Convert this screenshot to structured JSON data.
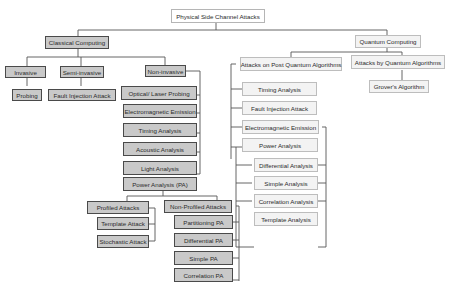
{
  "diagram": {
    "root": "Physical Side Channel Attacks",
    "classical": {
      "label": "Classical Computing",
      "invasive": {
        "label": "Invasive",
        "children": [
          "Probing"
        ]
      },
      "semi_invasive": {
        "label": "Semi-invasive",
        "children": [
          "Fault Injection Attack"
        ]
      },
      "non_invasive": {
        "label": "Non-invasive",
        "children": [
          "Optical/ Laser Probing",
          "Electromagnetic Emission",
          "Timing Analysis",
          "Acoustic Analysis",
          "Light Analysis",
          "Power Analysis (PA)"
        ],
        "power_analysis": {
          "profiled": {
            "label": "Profiled Attacks",
            "children": [
              "Template Attack",
              "Stochastic Attack"
            ]
          },
          "non_profiled": {
            "label": "Non-Profiled Attacks",
            "children": [
              "Partitioning PA",
              "Differential PA",
              "Simple PA",
              "Correlation PA"
            ]
          }
        }
      }
    },
    "quantum": {
      "label": "Quantum Computing",
      "post_quantum": {
        "label": "Attacks on Post Quantum Algorithms",
        "children": [
          "Timing Analysis",
          "Fault Injection Attack",
          "Electromagnetic Emission",
          "Power Analysis"
        ],
        "power_analysis_children": [
          "Differential Analysis",
          "Simple Analysis",
          "Correlation Analysis",
          "Template Analysis"
        ]
      },
      "by_quantum": {
        "label": "Attacks by Quantum Algorithms",
        "children": [
          "Grover's Algorithm"
        ]
      }
    }
  }
}
